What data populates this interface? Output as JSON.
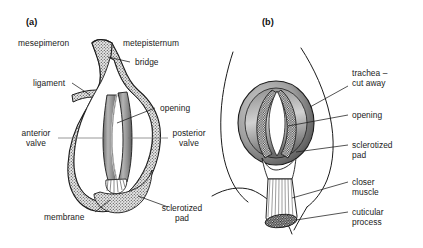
{
  "figure": {
    "type": "line-drawing-diagram",
    "background": "#ffffff",
    "ink": "#1a1a1a",
    "stipple_fill": "#d8d8d8",
    "shade_fill": "#9a9a9a"
  },
  "panels": [
    {
      "id": "a",
      "label": "(a)",
      "caption": "",
      "view": "spiracle valves, internal view",
      "labels": [
        {
          "key": "mesepimeron",
          "text": "mesepimeron",
          "align": "left",
          "leader": false
        },
        {
          "key": "metepisternum",
          "text": "metepisternum",
          "align": "left",
          "leader": false
        },
        {
          "key": "bridge",
          "text": "bridge",
          "align": "left",
          "leader": true
        },
        {
          "key": "ligament",
          "text": "ligament",
          "align": "left",
          "leader": true
        },
        {
          "key": "opening",
          "text": "opening",
          "align": "left",
          "leader": true
        },
        {
          "key": "anterior_valve",
          "text": "anterior\nvalve",
          "align": "center",
          "leader": true
        },
        {
          "key": "posterior_valve",
          "text": "posterior\nvalve",
          "align": "center",
          "leader": true
        },
        {
          "key": "membrane",
          "text": "membrane",
          "align": "left",
          "leader": true
        },
        {
          "key": "sclerotized_pad",
          "text": "sclerotized\npad",
          "align": "center",
          "leader": true
        }
      ]
    },
    {
      "id": "b",
      "label": "(b)",
      "caption": "",
      "view": "spiracle with trachea cut away, closer muscle",
      "labels": [
        {
          "key": "trachea_cut_away",
          "text": "trachea –\ncut away",
          "align": "left",
          "leader": true
        },
        {
          "key": "opening",
          "text": "opening",
          "align": "left",
          "leader": true
        },
        {
          "key": "sclerotized_pad",
          "text": "sclerotized\npad",
          "align": "left",
          "leader": true
        },
        {
          "key": "closer_muscle",
          "text": "closer\nmuscle",
          "align": "left",
          "leader": true
        },
        {
          "key": "cuticular_process",
          "text": "cuticular\nprocess",
          "align": "left",
          "leader": true
        }
      ]
    }
  ]
}
